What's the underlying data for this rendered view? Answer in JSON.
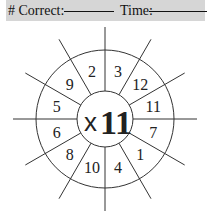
{
  "header": {
    "correct_label": "# Correct:",
    "time_label": "Time:"
  },
  "wheel": {
    "operator": "x",
    "multiplier": "11",
    "numbers": [
      "3",
      "12",
      "11",
      "7",
      "1",
      "4",
      "10",
      "8",
      "6",
      "5",
      "9",
      "2"
    ]
  }
}
